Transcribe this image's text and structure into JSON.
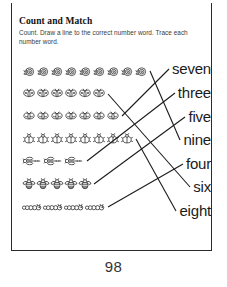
{
  "worksheet": {
    "title": "Count and Match",
    "instructions": "Count. Draw a line to the correct number word. Trace each number word.",
    "page_number": "98",
    "ink_color": "#1b1b1b",
    "rule_color": "#2b2b2b",
    "paper_color": "#ffffff"
  },
  "rows": [
    {
      "id": "row-snails",
      "icon": "snail-icon",
      "count": 9,
      "answer": "nine",
      "label": "row of 9 snails"
    },
    {
      "id": "row-butterflies",
      "icon": "butterfly-icon",
      "count": 6,
      "answer": "six",
      "label": "row of 6 butterflies"
    },
    {
      "id": "row-moths",
      "icon": "moth-icon",
      "count": 7,
      "answer": "seven",
      "label": "row of 7 moths"
    },
    {
      "id": "row-beetles",
      "icon": "beetle-icon",
      "count": 8,
      "answer": "eight",
      "label": "row of 8 beetles"
    },
    {
      "id": "row-dragonflies",
      "icon": "dragonfly-icon",
      "count": 3,
      "answer": "three",
      "label": "row of 3 dragonflies"
    },
    {
      "id": "row-bees",
      "icon": "bee-icon",
      "count": 5,
      "answer": "five",
      "label": "row of 5 bees"
    },
    {
      "id": "row-caterpillars",
      "icon": "caterpillar-icon",
      "count": 4,
      "answer": "four",
      "label": "row of 4 caterpillars"
    }
  ],
  "words": [
    {
      "id": "word-seven",
      "text": "seven"
    },
    {
      "id": "word-three",
      "text": "three"
    },
    {
      "id": "word-five",
      "text": "five"
    },
    {
      "id": "word-nine",
      "text": "nine"
    },
    {
      "id": "word-four",
      "text": "four"
    },
    {
      "id": "word-six",
      "text": "six"
    },
    {
      "id": "word-eight",
      "text": "eight"
    }
  ],
  "matches": [
    {
      "from_row": "row-snails",
      "to_word": "word-nine"
    },
    {
      "from_row": "row-butterflies",
      "to_word": "word-six"
    },
    {
      "from_row": "row-moths",
      "to_word": "word-seven"
    },
    {
      "from_row": "row-beetles",
      "to_word": "word-eight"
    },
    {
      "from_row": "row-dragonflies",
      "to_word": "word-three"
    },
    {
      "from_row": "row-bees",
      "to_word": "word-five"
    },
    {
      "from_row": "row-caterpillars",
      "to_word": "word-four"
    }
  ]
}
